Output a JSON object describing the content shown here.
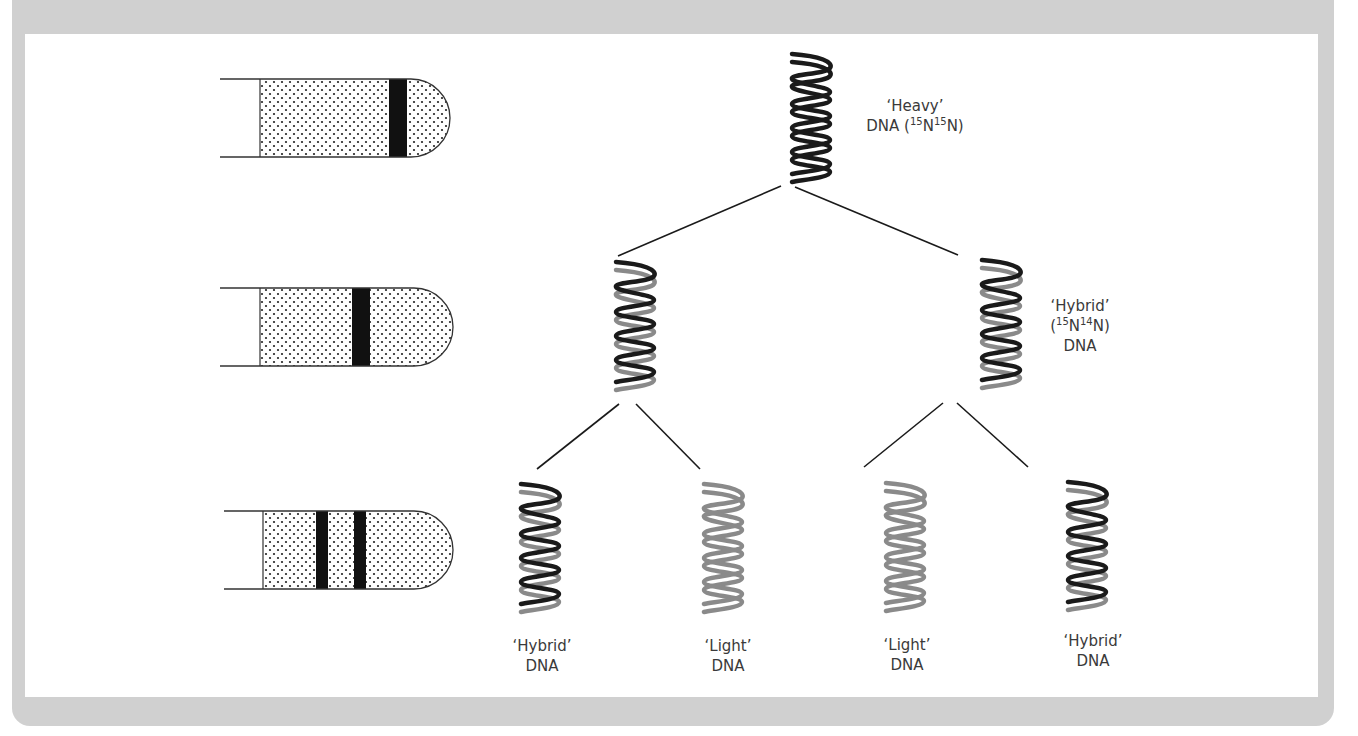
{
  "figure": {
    "colors": {
      "frame": "#d0d0d0",
      "panel": "#ffffff",
      "heavy_strand": "#1a1a1a",
      "light_strand": "#8a8a8a",
      "band": "#111111",
      "text": "#3a3a3a"
    }
  },
  "tubes": [
    {
      "id": "generation-0",
      "bands": [
        "heavy"
      ]
    },
    {
      "id": "generation-1",
      "bands": [
        "hybrid"
      ]
    },
    {
      "id": "generation-2",
      "bands": [
        "light",
        "hybrid"
      ]
    }
  ],
  "labels": {
    "heavy": {
      "line1": "‘Heavy’",
      "line2_prefix": "DNA (",
      "iso1": "15",
      "n1": "N",
      "iso2": "15",
      "n2": "N)"
    },
    "hybrid_mid": {
      "line1": "‘Hybrid’",
      "open": "(",
      "iso1": "15",
      "n1": "N",
      "iso2": "14",
      "n2": "N)",
      "line3": "DNA"
    },
    "bottom": [
      {
        "line1": "‘Hybrid’",
        "line2": "DNA"
      },
      {
        "line1": "‘Light’",
        "line2": "DNA"
      },
      {
        "line1": "‘Light’",
        "line2": "DNA"
      },
      {
        "line1": "‘Hybrid’",
        "line2": "DNA"
      }
    ]
  },
  "helices": [
    {
      "id": "heavy",
      "strands": [
        "heavy",
        "heavy"
      ]
    },
    {
      "id": "gen1-left",
      "strands": [
        "heavy",
        "light"
      ]
    },
    {
      "id": "gen1-right",
      "strands": [
        "heavy",
        "light"
      ]
    },
    {
      "id": "gen2-a",
      "strands": [
        "heavy",
        "light"
      ]
    },
    {
      "id": "gen2-b",
      "strands": [
        "light",
        "light"
      ]
    },
    {
      "id": "gen2-c",
      "strands": [
        "light",
        "light"
      ]
    },
    {
      "id": "gen2-d",
      "strands": [
        "heavy",
        "light"
      ]
    }
  ]
}
